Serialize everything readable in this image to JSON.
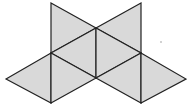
{
  "diagram": {
    "type": "octahedron-net",
    "face_count": 8,
    "colors": {
      "fill": "#d9d9d9",
      "stroke": "#222222",
      "background": "#ffffff",
      "artifact": "#9a9a9a"
    },
    "stroke_width": 1.2,
    "vertices": {
      "A": [
        51,
        3
      ],
      "B": [
        141,
        3
      ],
      "C": [
        96,
        28
      ],
      "D": [
        51,
        53
      ],
      "E": [
        141,
        53
      ],
      "F": [
        96,
        78
      ],
      "G": [
        6,
        79
      ],
      "H": [
        186,
        79
      ],
      "I": [
        51,
        103
      ],
      "J": [
        141,
        103
      ]
    },
    "faces": [
      {
        "name": "top-left-face",
        "vertices": [
          "A",
          "C",
          "D"
        ]
      },
      {
        "name": "top-right-face",
        "vertices": [
          "B",
          "C",
          "E"
        ]
      },
      {
        "name": "center-left-face",
        "vertices": [
          "D",
          "C",
          "F"
        ]
      },
      {
        "name": "center-right-face",
        "vertices": [
          "C",
          "E",
          "F"
        ]
      },
      {
        "name": "far-left-face",
        "vertices": [
          "G",
          "D",
          "I"
        ]
      },
      {
        "name": "bottom-left-face",
        "vertices": [
          "D",
          "F",
          "I"
        ]
      },
      {
        "name": "bottom-right-face",
        "vertices": [
          "F",
          "E",
          "J"
        ]
      },
      {
        "name": "far-right-face",
        "vertices": [
          "E",
          "H",
          "J"
        ]
      }
    ],
    "artifact_dot": [
      161,
      42
    ]
  }
}
